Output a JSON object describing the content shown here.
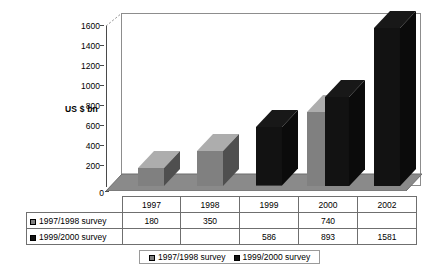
{
  "chart_data": {
    "type": "bar",
    "title": "",
    "subtitle": "",
    "xlabel": "",
    "ylabel": "US $ bn",
    "categories": [
      "1997",
      "1998",
      "1999",
      "2000",
      "2002"
    ],
    "series": [
      {
        "name": "1997/1998 survey",
        "color": "#808080",
        "values": [
          180,
          350,
          null,
          740,
          null
        ]
      },
      {
        "name": "1999/2000 survey",
        "color": "#121212",
        "values": [
          null,
          null,
          586,
          893,
          1581
        ]
      }
    ],
    "yticks": [
      "0",
      "200",
      "400",
      "600",
      "800",
      "1000",
      "1200",
      "1400",
      "1600"
    ],
    "ylim": [
      0,
      1600
    ],
    "grid": false,
    "legend_position": "bottom",
    "three_d": true
  },
  "axis": {
    "y_label": "US $ bn",
    "zero_label": "0",
    "ticks": [
      {
        "value": 1600,
        "label": "1600"
      },
      {
        "value": 1400,
        "label": "1400"
      },
      {
        "value": 1200,
        "label": "1200"
      },
      {
        "value": 1000,
        "label": "1000"
      },
      {
        "value": 800,
        "label": "800"
      },
      {
        "value": 600,
        "label": "600"
      },
      {
        "value": 400,
        "label": "400"
      },
      {
        "value": 200,
        "label": "200"
      }
    ]
  },
  "table": {
    "corner": "",
    "columns": [
      "1997",
      "1998",
      "1999",
      "2000",
      "2002"
    ],
    "rows": [
      {
        "label": "1997/1998 survey",
        "swatch": "#808080",
        "cells": [
          "180",
          "350",
          "",
          "740",
          ""
        ]
      },
      {
        "label": "1999/2000 survey",
        "swatch": "#121212",
        "cells": [
          "",
          "",
          "586",
          "893",
          "1581"
        ]
      }
    ]
  },
  "legend": {
    "items": [
      {
        "label": "1997/1998 survey",
        "color": "#808080"
      },
      {
        "label": "1999/2000 survey",
        "color": "#121212"
      }
    ]
  }
}
